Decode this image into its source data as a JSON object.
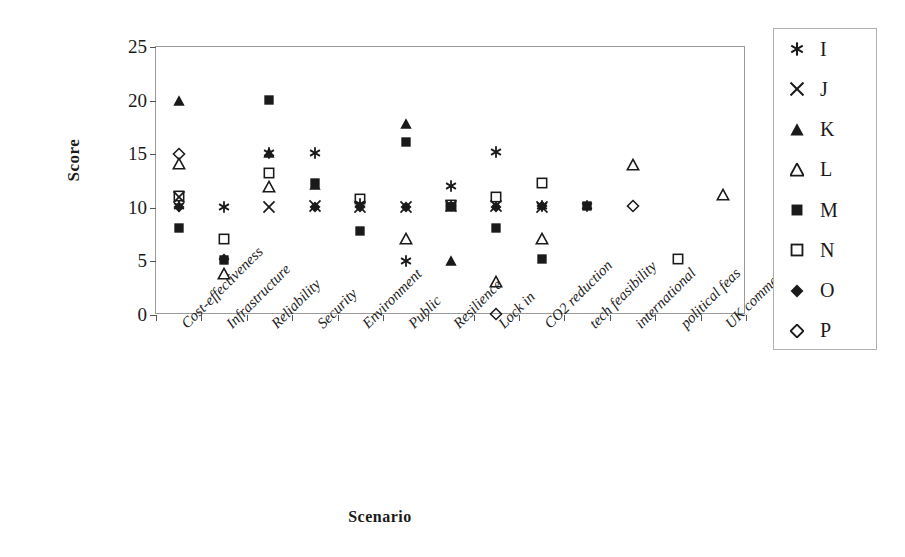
{
  "chart_data": {
    "type": "scatter",
    "title": "",
    "xlabel": "Scenario",
    "ylabel": "Score",
    "ylim": [
      0,
      25
    ],
    "yticks": [
      0,
      5,
      10,
      15,
      20,
      25
    ],
    "grid": false,
    "legend_position": "right",
    "categories": [
      "Cost-effectiveness",
      "Infrastructure",
      "Reliability",
      "Security",
      "Environment",
      "Public",
      "Resilience",
      "Lock in",
      "CO2 reduction",
      "tech feasibility",
      "international",
      "political feas",
      "UK commerce"
    ],
    "series": [
      {
        "name": "I",
        "marker": "asterisk",
        "values": [
          10.2,
          10.1,
          15.1,
          15.1,
          10.4,
          5.0,
          12.0,
          15.2,
          10.2,
          10.2,
          null,
          null,
          null
        ]
      },
      {
        "name": "J",
        "marker": "cross",
        "values": [
          11.0,
          null,
          10.1,
          10.2,
          10.1,
          10.1,
          10.2,
          10.2,
          10.1,
          null,
          null,
          null,
          null
        ]
      },
      {
        "name": "K",
        "marker": "filled-triangle",
        "values": [
          20.0,
          null,
          15.1,
          12.1,
          null,
          17.8,
          5.0,
          null,
          null,
          null,
          null,
          null,
          null
        ]
      },
      {
        "name": "L",
        "marker": "open-triangle",
        "values": [
          14.1,
          3.8,
          11.9,
          null,
          null,
          7.1,
          null,
          3.1,
          7.1,
          null,
          14.0,
          null,
          11.2
        ]
      },
      {
        "name": "M",
        "marker": "filled-square",
        "values": [
          8.1,
          5.1,
          20.1,
          12.3,
          7.8,
          16.1,
          10.1,
          8.1,
          5.2,
          10.2,
          null,
          null,
          null
        ]
      },
      {
        "name": "N",
        "marker": "open-square",
        "values": [
          11.1,
          7.1,
          13.2,
          null,
          10.8,
          null,
          10.3,
          11.0,
          12.3,
          null,
          null,
          5.2,
          null
        ]
      },
      {
        "name": "O",
        "marker": "filled-diamond",
        "values": [
          10.1,
          5.2,
          null,
          10.1,
          10.1,
          10.1,
          10.2,
          10.1,
          10.2,
          null,
          null,
          null,
          null
        ]
      },
      {
        "name": "P",
        "marker": "open-diamond",
        "values": [
          15.0,
          null,
          null,
          null,
          null,
          null,
          null,
          0.1,
          null,
          null,
          10.2,
          null,
          null
        ]
      }
    ]
  },
  "legend": {
    "items": [
      {
        "label": "I",
        "marker": "asterisk"
      },
      {
        "label": "J",
        "marker": "cross"
      },
      {
        "label": "K",
        "marker": "filled-triangle"
      },
      {
        "label": "L",
        "marker": "open-triangle"
      },
      {
        "label": "M",
        "marker": "filled-square"
      },
      {
        "label": "N",
        "marker": "open-square"
      },
      {
        "label": "O",
        "marker": "filled-diamond"
      },
      {
        "label": "P",
        "marker": "open-diamond"
      }
    ]
  },
  "colors": {
    "marker": "#1a1a1a",
    "axis": "#9a9a9a",
    "text": "#1a1a1a",
    "background": "#ffffff"
  }
}
